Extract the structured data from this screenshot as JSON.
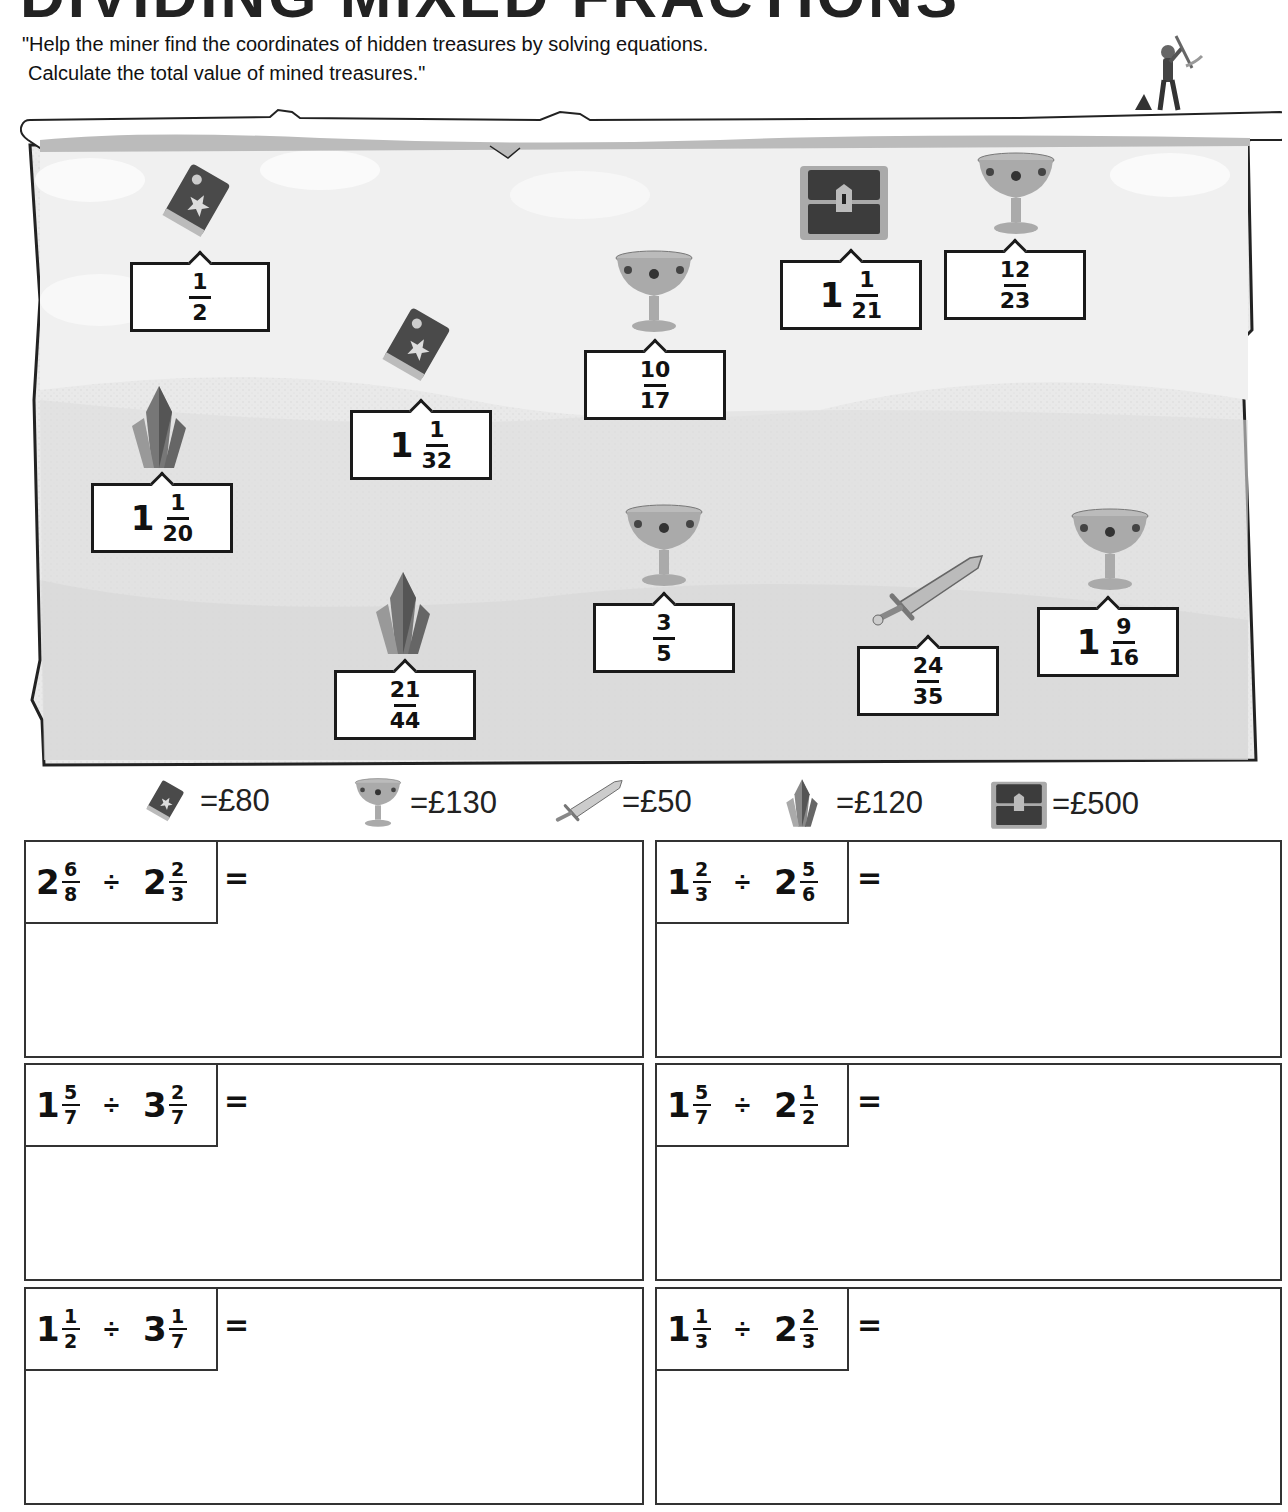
{
  "title": "DIVIDING MIXED FRACTIONS",
  "instructions": {
    "line1": "\"Help the miner find the coordinates of hidden treasures by solving equations.",
    "line2": "Calculate the total value of mined treasures.\""
  },
  "treasures": [
    {
      "type": "book",
      "whole": "",
      "num": "1",
      "den": "2"
    },
    {
      "type": "book",
      "whole": "1",
      "num": "1",
      "den": "32"
    },
    {
      "type": "crystal",
      "whole": "1",
      "num": "1",
      "den": "20"
    },
    {
      "type": "goblet",
      "whole": "",
      "num": "10",
      "den": "17"
    },
    {
      "type": "chest",
      "whole": "1",
      "num": "1",
      "den": "21"
    },
    {
      "type": "goblet",
      "whole": "",
      "num": "12",
      "den": "23"
    },
    {
      "type": "crystal",
      "whole": "",
      "num": "21",
      "den": "44"
    },
    {
      "type": "goblet",
      "whole": "",
      "num": "3",
      "den": "5"
    },
    {
      "type": "sword",
      "whole": "",
      "num": "24",
      "den": "35"
    },
    {
      "type": "goblet",
      "whole": "1",
      "num": "9",
      "den": "16"
    }
  ],
  "legend": [
    {
      "icon": "book-icon",
      "value": "=£80"
    },
    {
      "icon": "goblet-icon",
      "value": "=£130"
    },
    {
      "icon": "sword-icon",
      "value": "=£50"
    },
    {
      "icon": "crystal-icon",
      "value": "=£120"
    },
    {
      "icon": "chest-icon",
      "value": "=£500"
    }
  ],
  "problems": [
    {
      "a_whole": "2",
      "a_num": "6",
      "a_den": "8",
      "op": "÷",
      "b_whole": "2",
      "b_num": "2",
      "b_den": "3",
      "eq": "="
    },
    {
      "a_whole": "1",
      "a_num": "2",
      "a_den": "3",
      "op": "÷",
      "b_whole": "2",
      "b_num": "5",
      "b_den": "6",
      "eq": "="
    },
    {
      "a_whole": "1",
      "a_num": "5",
      "a_den": "7",
      "op": "÷",
      "b_whole": "3",
      "b_num": "2",
      "b_den": "7",
      "eq": "="
    },
    {
      "a_whole": "1",
      "a_num": "5",
      "a_den": "7",
      "op": "÷",
      "b_whole": "2",
      "b_num": "1",
      "b_den": "2",
      "eq": "="
    },
    {
      "a_whole": "1",
      "a_num": "1",
      "a_den": "2",
      "op": "÷",
      "b_whole": "3",
      "b_num": "1",
      "b_den": "7",
      "eq": "="
    },
    {
      "a_whole": "1",
      "a_num": "1",
      "a_den": "3",
      "op": "÷",
      "b_whole": "2",
      "b_num": "2",
      "b_den": "3",
      "eq": "="
    }
  ]
}
